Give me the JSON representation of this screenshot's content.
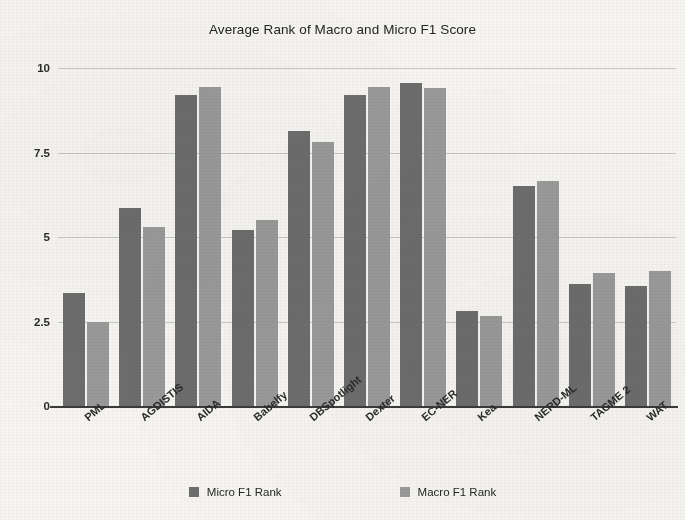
{
  "chart_data": {
    "type": "bar",
    "title": "Average Rank of Macro and Micro F1 Score",
    "xlabel": "",
    "ylabel": "",
    "ylim": [
      0,
      10
    ],
    "yticks": [
      "0",
      "2.5",
      "5",
      "7.5",
      "10"
    ],
    "ytick_values": [
      0,
      2.5,
      5,
      7.5,
      10
    ],
    "grid": true,
    "legend_position": "bottom",
    "categories": [
      "PML",
      "AGDISTIS",
      "AIDA",
      "Babelfy",
      "DBSpotlight",
      "Dexter",
      "EC-NER",
      "Kea",
      "NERD-ML",
      "TAGME 2",
      "WAT"
    ],
    "series": [
      {
        "name": "Micro F1 Rank",
        "color": "#6d6d6d",
        "values": [
          3.35,
          5.85,
          9.2,
          5.2,
          8.15,
          9.2,
          9.55,
          2.8,
          6.5,
          3.6,
          3.55
        ]
      },
      {
        "name": "Macro F1 Rank",
        "color": "#9a9a9a",
        "values": [
          2.5,
          5.3,
          9.45,
          5.5,
          7.8,
          9.45,
          9.4,
          2.65,
          6.65,
          3.95,
          4.0
        ]
      }
    ]
  },
  "figure": {
    "background_color": "#f6f5f2",
    "axis_color": "#3b3b3b",
    "gridline_color": "#c9c9c4"
  }
}
